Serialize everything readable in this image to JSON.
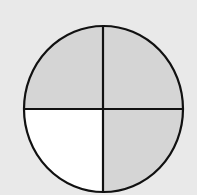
{
  "diagram": {
    "type": "fraction-circle",
    "total_parts": 4,
    "shaded_parts": 3,
    "quadrants": [
      {
        "position": "top-left",
        "shaded": true
      },
      {
        "position": "top-right",
        "shaded": true
      },
      {
        "position": "bottom-right",
        "shaded": true
      },
      {
        "position": "bottom-left",
        "shaded": false
      }
    ],
    "colors": {
      "background": "#e9e9e9",
      "shaded": "#d5d5d5",
      "unshaded": "#ffffff",
      "stroke": "#111111"
    }
  }
}
